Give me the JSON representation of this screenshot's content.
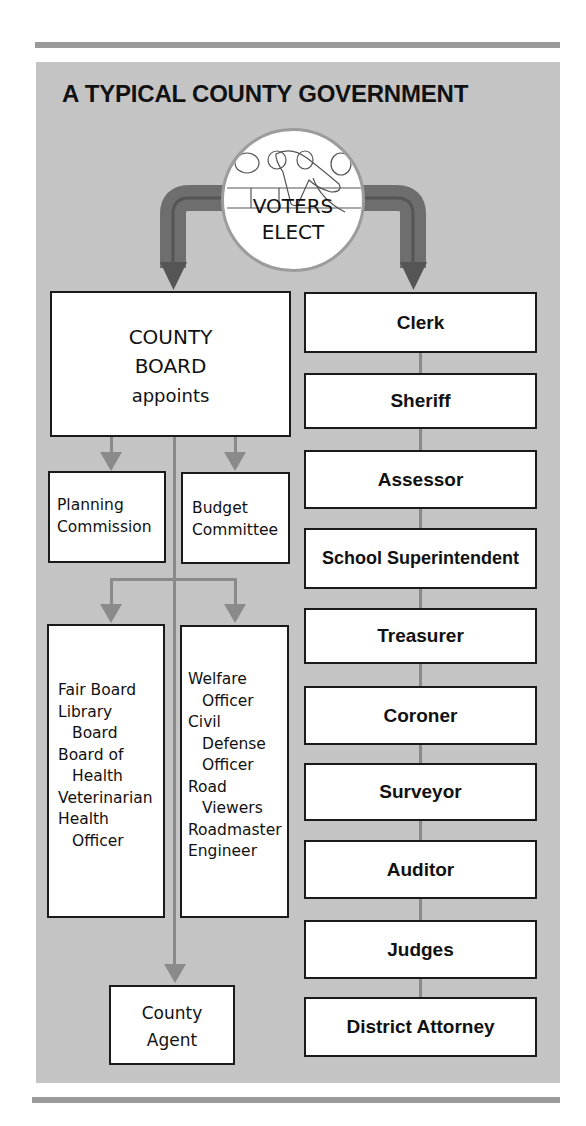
{
  "title": "A TYPICAL COUNTY GOVERNMENT",
  "voters": {
    "line1": "VOTERS",
    "line2": "ELECT",
    "icon": "hand-voting-machine-icon"
  },
  "county_board": {
    "line1": "COUNTY",
    "line2": "BOARD",
    "line3": "appoints"
  },
  "appointed_upper": [
    {
      "lines": [
        "Planning",
        "Commission"
      ]
    },
    {
      "lines": [
        "Budget",
        "Committee"
      ]
    }
  ],
  "appointed_lower_left": [
    {
      "text": "Fair Board",
      "indent": false
    },
    {
      "text": "Library",
      "indent": false
    },
    {
      "text": "Board",
      "indent": true
    },
    {
      "text": "Board of",
      "indent": false
    },
    {
      "text": "Health",
      "indent": true
    },
    {
      "text": "Veterinarian",
      "indent": false
    },
    {
      "text": "Health",
      "indent": false
    },
    {
      "text": "Officer",
      "indent": true
    }
  ],
  "appointed_lower_right": [
    {
      "text": "Welfare",
      "indent": false
    },
    {
      "text": "Officer",
      "indent": true
    },
    {
      "text": "Civil",
      "indent": false
    },
    {
      "text": "Defense",
      "indent": true
    },
    {
      "text": "Officer",
      "indent": true
    },
    {
      "text": "Road",
      "indent": false
    },
    {
      "text": "Viewers",
      "indent": true
    },
    {
      "text": "Roadmaster",
      "indent": false
    },
    {
      "text": "Engineer",
      "indent": false
    }
  ],
  "county_agent": {
    "line1": "County",
    "line2": "Agent"
  },
  "elected_officials": [
    "Clerk",
    "Sheriff",
    "Assessor",
    "School Superintendent",
    "Treasurer",
    "Coroner",
    "Surveyor",
    "Auditor",
    "Judges",
    "District Attorney"
  ],
  "colors": {
    "panel": "#c4c4c4",
    "rule": "#9a9a9a",
    "elect_arrow": "#6e6e6e",
    "appoint_arrow": "#8a8a8a",
    "box_border": "#1a1a1a"
  }
}
